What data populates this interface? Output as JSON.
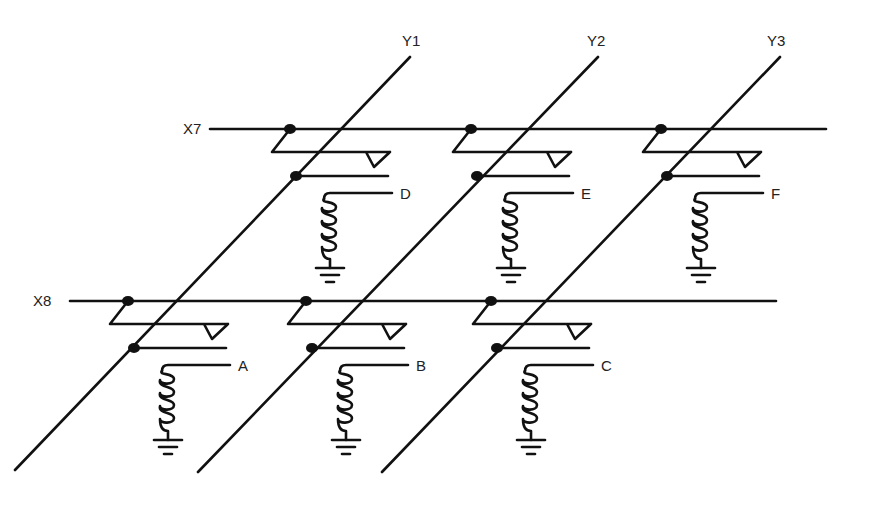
{
  "diagram": {
    "type": "core-memory-matrix",
    "column_lines": [
      {
        "label": "Y1",
        "top": [
          410,
          57
        ],
        "bottom": [
          15,
          470
        ],
        "label_pos": [
          402,
          46
        ]
      },
      {
        "label": "Y2",
        "top": [
          598,
          57
        ],
        "bottom": [
          198,
          472
        ],
        "label_pos": [
          587,
          46
        ]
      },
      {
        "label": "Y3",
        "top": [
          780,
          57
        ],
        "bottom": [
          382,
          472
        ],
        "label_pos": [
          767,
          46
        ]
      }
    ],
    "row_lines": [
      {
        "label": "X7",
        "y": 129,
        "x_start": 210,
        "x_end": 826,
        "label_pos": [
          183,
          134
        ]
      },
      {
        "label": "X8",
        "y": 301,
        "x_start": 70,
        "x_end": 776,
        "label_pos": [
          33,
          306
        ]
      }
    ],
    "cells": [
      {
        "label": "D",
        "row": "X7",
        "column": "Y1",
        "origin": [
          290,
          129
        ]
      },
      {
        "label": "E",
        "row": "X7",
        "column": "Y2",
        "origin": [
          471,
          129
        ]
      },
      {
        "label": "F",
        "row": "X7",
        "column": "Y3",
        "origin": [
          661,
          129
        ]
      },
      {
        "label": "A",
        "row": "X8",
        "column": "Y1",
        "origin": [
          128,
          301
        ]
      },
      {
        "label": "B",
        "row": "X8",
        "column": "Y2",
        "origin": [
          306,
          301
        ]
      },
      {
        "label": "C",
        "row": "X8",
        "column": "Y3",
        "origin": [
          491,
          301
        ]
      }
    ]
  }
}
